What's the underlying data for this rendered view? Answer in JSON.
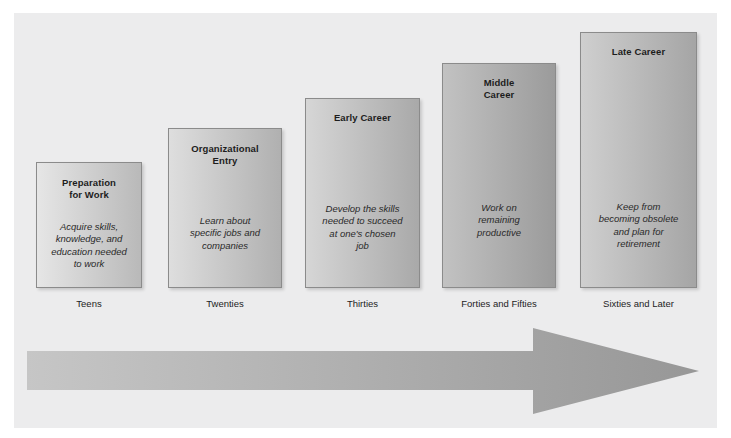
{
  "figure": {
    "panel_color": "#ececed",
    "background_color": "#ffffff"
  },
  "chart_data": {
    "type": "bar",
    "title": "Linear Career Path",
    "xlabel": "",
    "ylabel": "",
    "grid": false,
    "legend": "none",
    "categories": [
      "Teens",
      "Twenties",
      "Thirties",
      "Forties and Fifties",
      "Sixties and Later"
    ],
    "series": [
      {
        "name": "Career Stage Height",
        "values": [
          126,
          160,
          190,
          225,
          256
        ]
      }
    ],
    "annotations": [
      "Preparation for Work",
      "Organizational Entry",
      "Early Career",
      "Middle Career",
      "Late Career"
    ]
  },
  "stages": [
    {
      "title": "Preparation\nfor Work",
      "body": "Acquire skills,\nknowledge, and\neducation needed\nto work",
      "age_label": "Teens",
      "left": 36,
      "width": 106,
      "top": 162,
      "height": 126,
      "fill_start": "#e6e6e6",
      "fill_end": "#b9b9b9",
      "title_top": 14,
      "body_top": 58
    },
    {
      "title": "Organizational\nEntry",
      "body": "Learn about\nspecific jobs and\ncompanies",
      "age_label": "Twenties",
      "left": 168,
      "width": 114,
      "top": 128,
      "height": 160,
      "fill_start": "#dedede",
      "fill_end": "#b0b0b0",
      "title_top": 14,
      "body_top": 86
    },
    {
      "title": "Early Career",
      "body": "Develop the skills\nneeded to succeed\nat one's chosen\njob",
      "age_label": "Thirties",
      "left": 305,
      "width": 115,
      "top": 98,
      "height": 190,
      "fill_start": "#d6d6d6",
      "fill_end": "#a9a9a9",
      "title_top": 13,
      "body_top": 104
    },
    {
      "title": "Middle\nCareer",
      "body": "Work on\nremaining\nproductive",
      "age_label": "Forties and Fifties",
      "left": 442,
      "width": 114,
      "top": 63,
      "height": 225,
      "fill_start": "#c2c2c2",
      "fill_end": "#9b9b9b",
      "title_top": 13,
      "body_top": 138
    },
    {
      "title": "Late Career",
      "body": "Keep from\nbecoming obsolete\nand plan for\nretirement",
      "age_label": "Sixties and Later",
      "left": 580,
      "width": 117,
      "top": 32,
      "height": 256,
      "fill_start": "#cfcfcf",
      "fill_end": "#a5a5a5",
      "title_top": 13,
      "body_top": 168
    }
  ],
  "arrow": {
    "label": "Linear Career Path",
    "fill_start": "#c6c6c6",
    "fill_end": "#979797"
  }
}
